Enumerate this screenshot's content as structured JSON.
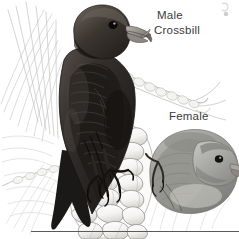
{
  "figure": {
    "kind": "illustration",
    "background_color": "#ffffff",
    "width": 239,
    "height": 239
  },
  "labels": {
    "male_line1": "Male",
    "male_line2": "Crossbill",
    "female": "Female"
  },
  "label_style": {
    "text_color": "#3a3a3a",
    "font_size_px": 11.5
  },
  "rule": {
    "color": "#5a5a5a",
    "thickness_px": 1,
    "x_start": 31,
    "x_end": 239,
    "y": 231
  },
  "artwork": {
    "male_bird": {
      "name": "male-crossbill",
      "plumage_tone": "#2a2724",
      "highlight_tone": "#6b6460",
      "bill": "crossed, pale gray",
      "pose": "perched upright on cone, facing right",
      "notes": "dark brick/near-black body, forked tail pointing down-left"
    },
    "female_bird": {
      "name": "female-crossbill",
      "plumage_tone": "#9a9a98",
      "highlight_tone": "#cfcfcd",
      "bill": "crossed, pale gray",
      "pose": "perched low right, facing right",
      "notes": "dull gray-olive, paler than male"
    },
    "pine_cone": {
      "name": "pine-cone",
      "tone": "#f2f1ef",
      "outline_tone": "#8b8b89",
      "scale_rows": 7
    },
    "foliage": {
      "name": "pine-needles",
      "tone": "#c9c9c7",
      "notes": "fine needle strokes in background, left and upper right"
    },
    "branch": {
      "name": "pine-branch",
      "tone": "#cbcbc9",
      "notes": "diagonal twig with small scales behind male, upper right"
    },
    "corner_mark": {
      "name": "faint-corner-mark",
      "tone": "#b9b9b7"
    }
  }
}
